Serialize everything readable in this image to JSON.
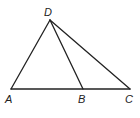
{
  "diagram": {
    "type": "geometry-triangle",
    "points": {
      "A": {
        "label": "A",
        "x": 11,
        "y": 89
      },
      "B": {
        "label": "B",
        "x": 83,
        "y": 89
      },
      "C": {
        "label": "C",
        "x": 130,
        "y": 89
      },
      "D": {
        "label": "D",
        "x": 50,
        "y": 20
      }
    },
    "segments": [
      "DA",
      "DB",
      "DC",
      "AC"
    ],
    "stroke_color": "#222222"
  }
}
